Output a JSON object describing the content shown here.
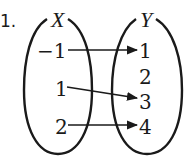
{
  "problem_label": "1.",
  "sets": {
    "domain": {
      "name": "X",
      "elements": [
        "−1",
        "1",
        "2"
      ]
    },
    "codomain": {
      "name": "Y",
      "elements": [
        "1",
        "2",
        "3",
        "4"
      ]
    }
  },
  "mappings": [
    {
      "from": "−1",
      "to": "1"
    },
    {
      "from": "1",
      "to": "3"
    },
    {
      "from": "2",
      "to": "4"
    }
  ],
  "colors": {
    "ink": "#1a1a1a",
    "background": "#ffffff"
  }
}
